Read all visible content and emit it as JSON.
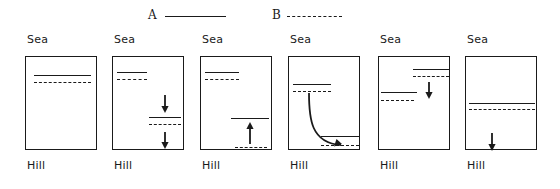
{
  "figure": {
    "width": 560,
    "height": 189,
    "background": "#ffffff",
    "ink_color": "#1a1a1a"
  },
  "legend": {
    "entries": [
      {
        "label": "A",
        "style": "solid",
        "x": 148,
        "line_width": 61
      },
      {
        "label": "B",
        "style": "dashed",
        "x": 272,
        "line_width": 55
      }
    ]
  },
  "panels": [
    {
      "index": 1,
      "top_label": "Sea",
      "bottom_label": "Hill",
      "x": 25,
      "lines": [
        {
          "series": "A",
          "style": "solid",
          "x": 8,
          "y": 18,
          "w": 57
        },
        {
          "series": "B",
          "style": "dashed",
          "x": 8,
          "y": 25,
          "w": 57
        }
      ],
      "arrows": []
    },
    {
      "index": 2,
      "top_label": "Sea",
      "bottom_label": "Hill",
      "x": 112,
      "lines": [
        {
          "series": "A",
          "style": "solid",
          "x": 4,
          "y": 15,
          "w": 30
        },
        {
          "series": "B",
          "style": "dashed",
          "x": 4,
          "y": 22,
          "w": 30
        },
        {
          "series": "A",
          "style": "solid",
          "x": 36,
          "y": 60,
          "w": 32
        },
        {
          "series": "B",
          "style": "dashed",
          "x": 36,
          "y": 67,
          "w": 32
        }
      ],
      "arrows": [
        {
          "type": "straight",
          "direction": "down",
          "x": 52,
          "y1": 38,
          "y2": 56
        },
        {
          "type": "straight",
          "direction": "down",
          "x": 52,
          "y1": 75,
          "y2": 92
        }
      ]
    },
    {
      "index": 3,
      "top_label": "Sea",
      "bottom_label": "Hill",
      "x": 200,
      "lines": [
        {
          "series": "A",
          "style": "solid",
          "x": 4,
          "y": 15,
          "w": 34
        },
        {
          "series": "B",
          "style": "dashed",
          "x": 4,
          "y": 22,
          "w": 34
        },
        {
          "series": "A",
          "style": "solid",
          "x": 30,
          "y": 61,
          "w": 38
        },
        {
          "series": "B",
          "style": "dashed",
          "x": 34,
          "y": 90,
          "w": 32
        }
      ],
      "arrows": [
        {
          "type": "straight",
          "direction": "up",
          "x": 49,
          "y1": 87,
          "y2": 65
        }
      ]
    },
    {
      "index": 4,
      "top_label": "Sea",
      "bottom_label": "Hill",
      "x": 288,
      "lines": [
        {
          "series": "A",
          "style": "solid",
          "x": 4,
          "y": 27,
          "w": 38
        },
        {
          "series": "B",
          "style": "dashed",
          "x": 4,
          "y": 34,
          "w": 38
        },
        {
          "series": "A",
          "style": "solid",
          "x": 32,
          "y": 79,
          "w": 38
        },
        {
          "series": "B",
          "style": "dashed",
          "x": 32,
          "y": 88,
          "w": 38
        }
      ],
      "arrows": [
        {
          "type": "curved",
          "direction": "down-right",
          "path": "M 20 36 C 20 62, 22 86, 52 88"
        }
      ]
    },
    {
      "index": 5,
      "top_label": "Sea",
      "bottom_label": "Hill",
      "x": 378,
      "lines": [
        {
          "series": "A",
          "style": "solid",
          "x": 34,
          "y": 12,
          "w": 36
        },
        {
          "series": "B",
          "style": "dashed",
          "x": 34,
          "y": 19,
          "w": 36
        },
        {
          "series": "A",
          "style": "solid",
          "x": 2,
          "y": 35,
          "w": 36
        },
        {
          "series": "B",
          "style": "dashed",
          "x": 2,
          "y": 43,
          "w": 33
        }
      ],
      "arrows": [
        {
          "type": "straight",
          "direction": "down",
          "x": 50,
          "y1": 25,
          "y2": 42
        }
      ]
    },
    {
      "index": 6,
      "top_label": "Sea",
      "bottom_label": "Hill",
      "x": 465,
      "lines": [
        {
          "series": "A",
          "style": "solid",
          "x": 3,
          "y": 46,
          "w": 66
        },
        {
          "series": "B",
          "style": "dashed",
          "x": 3,
          "y": 52,
          "w": 66
        }
      ],
      "arrows": [
        {
          "type": "straight",
          "direction": "down",
          "x": 26,
          "y1": 76,
          "y2": 94
        }
      ]
    }
  ]
}
